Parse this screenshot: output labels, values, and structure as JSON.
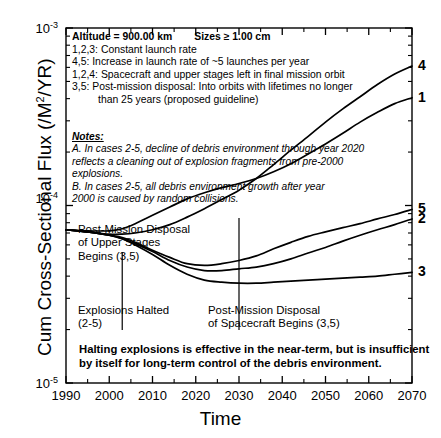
{
  "chart_data": {
    "type": "line",
    "title": "",
    "xlabel": "Time",
    "ylabel": "Cum Cross-Sectional Flux (/M2/YR)",
    "ylabel_parts": {
      "pre": "Cum Cross-Sectional Flux (/M",
      "sup": "2",
      "post": "/YR)"
    },
    "xlim": [
      1990,
      2070
    ],
    "ylim": [
      1e-05,
      0.001
    ],
    "yscale": "log",
    "xscale": "linear",
    "grid": false,
    "legend_position": "inside-top-left",
    "xticks": [
      "1990",
      "2000",
      "2010",
      "2020",
      "2030",
      "2040",
      "2050",
      "2060",
      "2070"
    ],
    "xtick_values": [
      1990,
      2000,
      2010,
      2020,
      2030,
      2040,
      2050,
      2060,
      2070
    ],
    "xminor_step": 5,
    "yticks": [
      {
        "mantissa": "10",
        "exponent": "-3",
        "value": 0.001
      },
      {
        "mantissa": "10",
        "exponent": "-4",
        "value": 0.0001
      },
      {
        "mantissa": "10",
        "exponent": "-5",
        "value": 1e-05
      }
    ],
    "series": [
      {
        "name": "4",
        "label": "4",
        "color": "#000000",
        "x": [
          1990,
          1995,
          2000,
          2003,
          2006,
          2010,
          2014,
          2018,
          2022,
          2026,
          2030,
          2034,
          2038,
          2042,
          2046,
          2050,
          2054,
          2058,
          2062,
          2066,
          2070
        ],
        "y": [
          7.3e-05,
          7.1e-05,
          6.9e-05,
          6.9e-05,
          7e-05,
          7.3e-05,
          7.8e-05,
          8.6e-05,
          9.6e-05,
          0.000108,
          0.000122,
          0.000142,
          0.00017,
          0.000205,
          0.000245,
          0.000295,
          0.00035,
          0.00041,
          0.00048,
          0.00055,
          0.00061
        ]
      },
      {
        "name": "1",
        "label": "1",
        "color": "#000000",
        "x": [
          1990,
          1995,
          2000,
          2003,
          2006,
          2010,
          2014,
          2018,
          2022,
          2026,
          2030,
          2034,
          2038,
          2042,
          2046,
          2050,
          2054,
          2058,
          2062,
          2066,
          2070
        ],
        "y": [
          7.3e-05,
          7.2e-05,
          7.2e-05,
          7.4e-05,
          7.9e-05,
          8.8e-05,
          9.8e-05,
          0.000109,
          0.000118,
          0.000126,
          0.000133,
          0.000142,
          0.000155,
          0.000172,
          0.000195,
          0.000222,
          0.000255,
          0.000295,
          0.000335,
          0.000375,
          0.000405
        ]
      },
      {
        "name": "5",
        "label": "5",
        "color": "#000000",
        "x": [
          1990,
          1995,
          2000,
          2003,
          2006,
          2010,
          2014,
          2018,
          2022,
          2026,
          2030,
          2034,
          2038,
          2042,
          2046,
          2050,
          2054,
          2058,
          2062,
          2066,
          2070
        ],
        "y": [
          7.3e-05,
          7.1e-05,
          6.8e-05,
          6.6e-05,
          6.2e-05,
          5.6e-05,
          5.1e-05,
          4.7e-05,
          4.6e-05,
          4.7e-05,
          4.9e-05,
          5.2e-05,
          5.7e-05,
          6.2e-05,
          6.7e-05,
          7.1e-05,
          7.5e-05,
          7.9e-05,
          8.4e-05,
          8.9e-05,
          9.5e-05
        ]
      },
      {
        "name": "2",
        "label": "2",
        "color": "#000000",
        "x": [
          1990,
          1995,
          2000,
          2003,
          2006,
          2010,
          2014,
          2018,
          2022,
          2026,
          2030,
          2034,
          2038,
          2042,
          2046,
          2050,
          2054,
          2058,
          2062,
          2066,
          2070
        ],
        "y": [
          7.3e-05,
          7.1e-05,
          6.8e-05,
          6.5e-05,
          6.1e-05,
          5.5e-05,
          4.9e-05,
          4.5e-05,
          4.3e-05,
          4.3e-05,
          4.4e-05,
          4.5e-05,
          4.7e-05,
          5e-05,
          5.4e-05,
          5.8e-05,
          6.3e-05,
          6.8e-05,
          7.3e-05,
          7.8e-05,
          8.4e-05
        ]
      },
      {
        "name": "3",
        "label": "3",
        "color": "#000000",
        "x": [
          1990,
          1995,
          2000,
          2003,
          2006,
          2010,
          2014,
          2018,
          2022,
          2026,
          2030,
          2034,
          2038,
          2042,
          2046,
          2050,
          2054,
          2058,
          2062,
          2066,
          2070
        ],
        "y": [
          7.3e-05,
          7.1e-05,
          6.8e-05,
          6.5e-05,
          6e-05,
          5.3e-05,
          4.6e-05,
          4.1e-05,
          3.8e-05,
          3.7e-05,
          3.65e-05,
          3.65e-05,
          3.7e-05,
          3.75e-05,
          3.8e-05,
          3.85e-05,
          3.9e-05,
          3.95e-05,
          4e-05,
          4.1e-05,
          4.2e-05
        ]
      }
    ],
    "vertical_markers": [
      {
        "name": "upper-stage-disposal",
        "x": 2003
      },
      {
        "name": "spacecraft-disposal",
        "x": 2030
      }
    ]
  },
  "legend": {
    "header": {
      "altitude": "Altitude = 900.00 km",
      "sizes": "Sizes ≥ 1.00 cm"
    },
    "rows": [
      {
        "key": "1,2,3:",
        "text": "Constant launch rate"
      },
      {
        "key": "4,5:",
        "text": "Increase in launch rate of ~5 launches per year"
      },
      {
        "key": "1,2,4:",
        "text": "Spacecraft and upper stages left in final mission orbit"
      },
      {
        "key": "3,5:",
        "text": "Post-mission disposal:  Into orbits with lifetimes no longer"
      }
    ],
    "continuation": "than 25 years (proposed guideline)"
  },
  "notes": {
    "title": "Notes:",
    "lines": [
      "A.  In cases 2-5, decline of debris environment through year 2020",
      "reflects a cleaning out of explosion fragments from pre-2000",
      "explosions.",
      "B.  In cases 2-5, all debris environment growth after year",
      "2000 is caused by random collisions."
    ]
  },
  "annotations": {
    "upper_stage_disposal": "Post-Mission Disposal\nof Upper Stages\nBegins (3,5)",
    "explosions_halted": "Explosions Halted\n(2-5)",
    "spacecraft_disposal": "Post-Mission Disposal\nof Spacecraft Begins (3,5)"
  },
  "conclusion": "Halting explosions is effective in the near-term, but is insufficient\nby itself for long-term control of the debris environment.",
  "axis": {
    "xlabel": "Time",
    "ytick_top": {
      "m": "10",
      "e": "-3"
    },
    "ytick_mid": {
      "m": "10",
      "e": "-4"
    },
    "ytick_bot": {
      "m": "10",
      "e": "-5"
    }
  },
  "colors": {
    "ink": "#000000",
    "paper": "#ffffff"
  }
}
